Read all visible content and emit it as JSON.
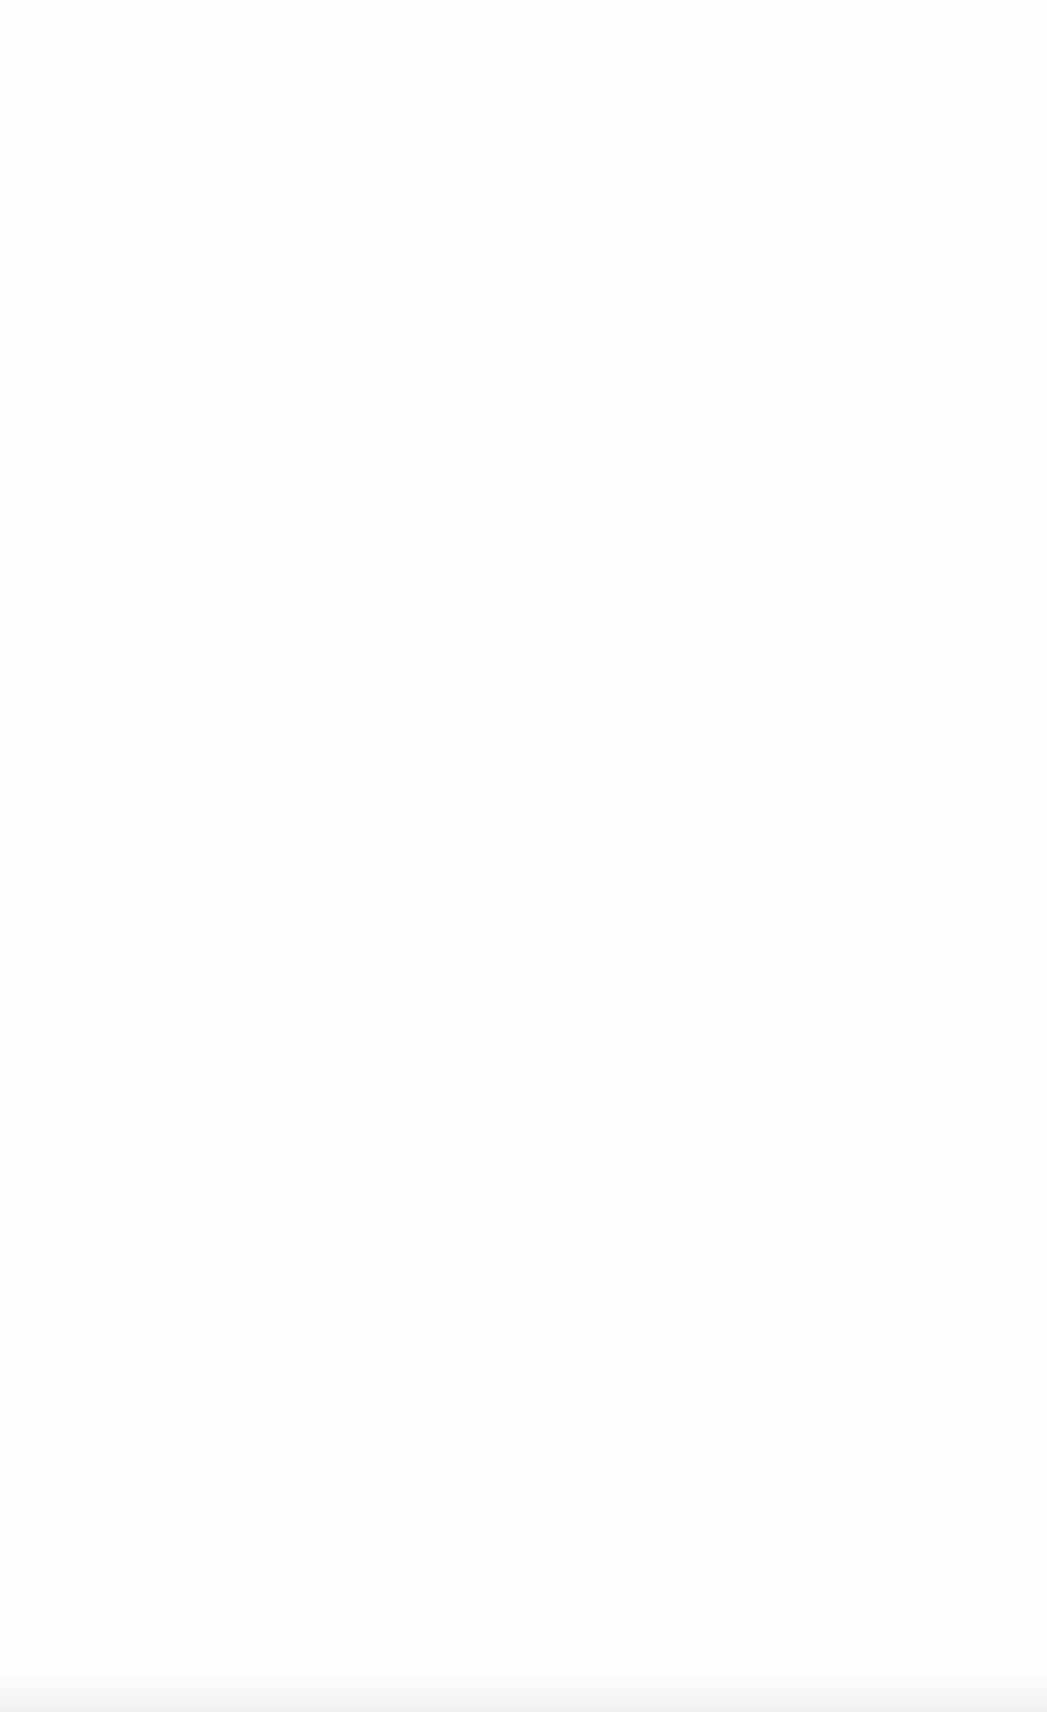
{
  "page": {
    "type": "lined-paper",
    "background": "#fdfdfd",
    "line_color": "#a0a0a0",
    "top_line": {
      "y": 157,
      "thickness": 4
    },
    "line_spacing": 54.9,
    "thin_line_count": 26,
    "left": 82,
    "right": 1022
  }
}
